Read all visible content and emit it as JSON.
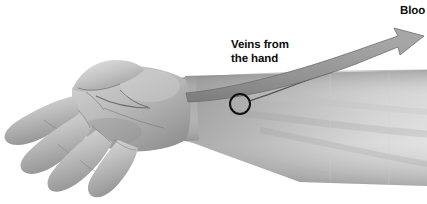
{
  "figure": {
    "background_color": "#ffffff",
    "width": 427,
    "height": 204
  },
  "labels": {
    "veins_from_hand": {
      "line1": "Veins from",
      "line2": "the hand",
      "color": "#0d0d0d"
    },
    "blood": {
      "text": "Bloo",
      "note_truncated": true,
      "color": "#0d0d0d"
    }
  },
  "markers": {
    "vein_site_circle": {
      "center_x": 240,
      "center_y": 104,
      "radius": 10,
      "stroke_color": "#111111",
      "stroke_width": 2
    },
    "leader_line": {
      "from_x": 250,
      "from_y": 100,
      "to_x": 330,
      "to_y": 72,
      "stroke_color": "#5a5a5a"
    }
  },
  "flow_arrow": {
    "name": "blood-flow-arrow",
    "direction": "up-right",
    "fill_color": "#8f8f8f",
    "edge_color": "#6d6d6d",
    "tip_x": 420,
    "tip_y": 36
  },
  "anatomy": {
    "skin_tone_light": "#d8d8d8",
    "skin_tone_mid": "#b4b4b4",
    "skin_tone_dark": "#8e8e8e",
    "skin_tone_shadow": "#6f6f6f",
    "parts": [
      "thumb",
      "index-finger",
      "middle-finger",
      "ring-finger",
      "little-finger",
      "palm",
      "wrist",
      "forearm"
    ]
  }
}
